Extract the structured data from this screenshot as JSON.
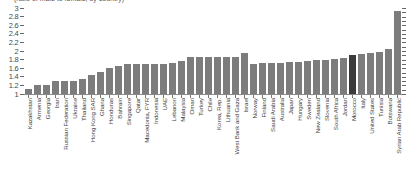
{
  "chart_data": {
    "type": "bar",
    "title": "(ratio of male to female, by country)",
    "xlabel": "",
    "ylabel": "",
    "ylim": [
      1,
      3
    ],
    "ytick_values": [
      1,
      1.2,
      1.4,
      1.6,
      1.8,
      2,
      2.2,
      2.4,
      2.6,
      2.8,
      3
    ],
    "ytick_labels": [
      "1",
      "1.2",
      "1.4",
      "1.6",
      "1.8",
      "2",
      "2.2",
      "2.4",
      "2.6",
      "2.8",
      "3"
    ],
    "grid": false,
    "legend": "none",
    "bar_color": "#7c7c7c",
    "highlight_color": "#3b3b3b",
    "highlight_category": "Morocco",
    "categories": [
      "Kazakhstan",
      "Armenia",
      "Georgia",
      "Iran",
      "Russian Federation",
      "Ukraine",
      "Thailand",
      "Hong Kong SAR",
      "Ghana",
      "Honduras",
      "Bahrain",
      "Singapore",
      "Qatar",
      "Macedonia, FYR",
      "Indonesia",
      "UAE",
      "Lebanon",
      "Malaysia",
      "Oman",
      "Turkey",
      "Chile",
      "Korea, Rep.",
      "Lithuania",
      "West Bank and Gaza",
      "Israel",
      "Norway",
      "Finland",
      "Saudi Arabia",
      "Australia",
      "Japan",
      "Hungary",
      "Sweden",
      "New Zealand",
      "Slovenia",
      "South Africa",
      "Jordan",
      "Morocco",
      "Italy",
      "United States",
      "Tunisia",
      "Botswana",
      "Syrian Arab Republic"
    ],
    "values": [
      1.12,
      1.22,
      1.22,
      1.3,
      1.31,
      1.31,
      1.36,
      1.45,
      1.52,
      1.6,
      1.64,
      1.69,
      1.7,
      1.7,
      1.7,
      1.7,
      1.72,
      1.76,
      1.86,
      1.86,
      1.86,
      1.87,
      1.87,
      1.87,
      1.95,
      1.7,
      1.72,
      1.72,
      1.73,
      1.74,
      1.75,
      1.76,
      1.78,
      1.8,
      1.82,
      1.84,
      1.9,
      1.94,
      1.96,
      1.98,
      2.05,
      2.92
    ]
  }
}
